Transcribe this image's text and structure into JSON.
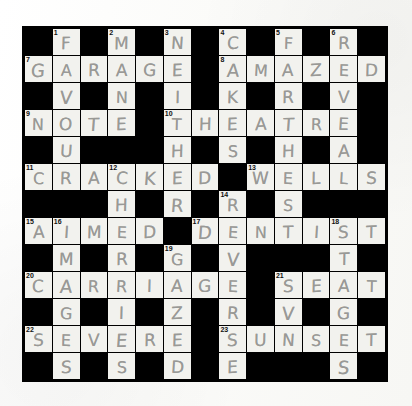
{
  "puzzle": {
    "type": "crossword-grid",
    "rows": 13,
    "cols": 13,
    "grid_background": "#000000",
    "cell_color": "#f2f2ee",
    "letter_color": "#8d8d8a",
    "number_color": "#111111",
    "layout_note": "Hand-filled crossword photographed on white paper",
    "cells": [
      [
        {
          "s": "black"
        },
        {
          "s": "white",
          "n": "1",
          "l": "F"
        },
        {
          "s": "black"
        },
        {
          "s": "white",
          "n": "2",
          "l": "M"
        },
        {
          "s": "black"
        },
        {
          "s": "white",
          "n": "3",
          "l": "N"
        },
        {
          "s": "black"
        },
        {
          "s": "white",
          "n": "4",
          "l": "C"
        },
        {
          "s": "black"
        },
        {
          "s": "white",
          "n": "5",
          "l": "F"
        },
        {
          "s": "black"
        },
        {
          "s": "white",
          "n": "6",
          "l": "R"
        },
        {
          "s": "black"
        }
      ],
      [
        {
          "s": "white",
          "n": "7",
          "l": "G"
        },
        {
          "s": "white",
          "l": "A"
        },
        {
          "s": "white",
          "l": "R"
        },
        {
          "s": "white",
          "l": "A"
        },
        {
          "s": "white",
          "l": "G"
        },
        {
          "s": "white",
          "l": "E"
        },
        {
          "s": "black"
        },
        {
          "s": "white",
          "n": "8",
          "l": "A"
        },
        {
          "s": "white",
          "l": "M"
        },
        {
          "s": "white",
          "l": "A"
        },
        {
          "s": "white",
          "l": "Z"
        },
        {
          "s": "white",
          "l": "E"
        },
        {
          "s": "white",
          "l": "D"
        }
      ],
      [
        {
          "s": "black"
        },
        {
          "s": "white",
          "l": "V"
        },
        {
          "s": "black"
        },
        {
          "s": "white",
          "l": "N"
        },
        {
          "s": "black"
        },
        {
          "s": "white",
          "l": "I"
        },
        {
          "s": "black"
        },
        {
          "s": "white",
          "l": "K"
        },
        {
          "s": "black"
        },
        {
          "s": "white",
          "l": "R"
        },
        {
          "s": "black"
        },
        {
          "s": "white",
          "l": "V"
        },
        {
          "s": "black"
        }
      ],
      [
        {
          "s": "white",
          "n": "9",
          "l": "N"
        },
        {
          "s": "white",
          "l": "O"
        },
        {
          "s": "white",
          "l": "T"
        },
        {
          "s": "white",
          "l": "E"
        },
        {
          "s": "black"
        },
        {
          "s": "white",
          "n": "10",
          "l": "T"
        },
        {
          "s": "white",
          "l": "H"
        },
        {
          "s": "white",
          "l": "E"
        },
        {
          "s": "white",
          "l": "A"
        },
        {
          "s": "white",
          "l": "T"
        },
        {
          "s": "white",
          "l": "R"
        },
        {
          "s": "white",
          "l": "E"
        },
        {
          "s": "black"
        }
      ],
      [
        {
          "s": "black"
        },
        {
          "s": "white",
          "l": "U"
        },
        {
          "s": "black"
        },
        {
          "s": "black"
        },
        {
          "s": "black"
        },
        {
          "s": "white",
          "l": "H"
        },
        {
          "s": "black"
        },
        {
          "s": "white",
          "l": "S"
        },
        {
          "s": "black"
        },
        {
          "s": "white",
          "l": "H"
        },
        {
          "s": "black"
        },
        {
          "s": "white",
          "l": "A"
        },
        {
          "s": "black"
        }
      ],
      [
        {
          "s": "white",
          "n": "11",
          "l": "C"
        },
        {
          "s": "white",
          "l": "R"
        },
        {
          "s": "white",
          "l": "A"
        },
        {
          "s": "white",
          "n": "12",
          "l": "C"
        },
        {
          "s": "white",
          "l": "K"
        },
        {
          "s": "white",
          "l": "E"
        },
        {
          "s": "white",
          "l": "D"
        },
        {
          "s": "black"
        },
        {
          "s": "white",
          "n": "13",
          "l": "W"
        },
        {
          "s": "white",
          "l": "E"
        },
        {
          "s": "white",
          "l": "L"
        },
        {
          "s": "white",
          "l": "L"
        },
        {
          "s": "white",
          "l": "S"
        }
      ],
      [
        {
          "s": "black"
        },
        {
          "s": "black"
        },
        {
          "s": "black"
        },
        {
          "s": "white",
          "l": "H"
        },
        {
          "s": "black"
        },
        {
          "s": "white",
          "l": "R"
        },
        {
          "s": "black"
        },
        {
          "s": "white",
          "n": "14",
          "l": "R"
        },
        {
          "s": "black"
        },
        {
          "s": "white",
          "l": "S"
        },
        {
          "s": "black"
        },
        {
          "s": "black"
        },
        {
          "s": "black"
        }
      ],
      [
        {
          "s": "white",
          "n": "15",
          "l": "A"
        },
        {
          "s": "white",
          "n": "16",
          "l": "I"
        },
        {
          "s": "white",
          "l": "M"
        },
        {
          "s": "white",
          "l": "E"
        },
        {
          "s": "white",
          "l": "D"
        },
        {
          "s": "black"
        },
        {
          "s": "white",
          "n": "17",
          "l": "D"
        },
        {
          "s": "white",
          "l": "E"
        },
        {
          "s": "white",
          "l": "N"
        },
        {
          "s": "white",
          "l": "T"
        },
        {
          "s": "white",
          "l": "I"
        },
        {
          "s": "white",
          "n": "18",
          "l": "S"
        },
        {
          "s": "white",
          "l": "T"
        }
      ],
      [
        {
          "s": "black"
        },
        {
          "s": "white",
          "l": "M"
        },
        {
          "s": "black"
        },
        {
          "s": "white",
          "l": "R"
        },
        {
          "s": "black"
        },
        {
          "s": "white",
          "n": "19",
          "l": "G"
        },
        {
          "s": "black"
        },
        {
          "s": "white",
          "l": "V"
        },
        {
          "s": "black"
        },
        {
          "s": "black"
        },
        {
          "s": "black"
        },
        {
          "s": "white",
          "l": "T"
        },
        {
          "s": "black"
        }
      ],
      [
        {
          "s": "white",
          "n": "20",
          "l": "C"
        },
        {
          "s": "white",
          "l": "A"
        },
        {
          "s": "white",
          "l": "R"
        },
        {
          "s": "white",
          "l": "R"
        },
        {
          "s": "white",
          "l": "I"
        },
        {
          "s": "white",
          "l": "A"
        },
        {
          "s": "white",
          "l": "G"
        },
        {
          "s": "white",
          "l": "E"
        },
        {
          "s": "black"
        },
        {
          "s": "white",
          "n": "21",
          "l": "S"
        },
        {
          "s": "white",
          "l": "E"
        },
        {
          "s": "white",
          "l": "A"
        },
        {
          "s": "white",
          "l": "T"
        }
      ],
      [
        {
          "s": "black"
        },
        {
          "s": "white",
          "l": "G"
        },
        {
          "s": "black"
        },
        {
          "s": "white",
          "l": "I"
        },
        {
          "s": "black"
        },
        {
          "s": "white",
          "l": "Z"
        },
        {
          "s": "black"
        },
        {
          "s": "white",
          "l": "R"
        },
        {
          "s": "black"
        },
        {
          "s": "white",
          "l": "V"
        },
        {
          "s": "black"
        },
        {
          "s": "white",
          "l": "G"
        },
        {
          "s": "black"
        }
      ],
      [
        {
          "s": "white",
          "n": "22",
          "l": "S"
        },
        {
          "s": "white",
          "l": "E"
        },
        {
          "s": "white",
          "l": "V"
        },
        {
          "s": "white",
          "l": "E"
        },
        {
          "s": "white",
          "l": "R"
        },
        {
          "s": "white",
          "l": "E"
        },
        {
          "s": "black"
        },
        {
          "s": "white",
          "n": "23",
          "l": "S"
        },
        {
          "s": "white",
          "l": "U"
        },
        {
          "s": "white",
          "l": "N"
        },
        {
          "s": "white",
          "l": "S"
        },
        {
          "s": "white",
          "l": "E"
        },
        {
          "s": "white",
          "l": "T"
        }
      ],
      [
        {
          "s": "black"
        },
        {
          "s": "white",
          "l": "S"
        },
        {
          "s": "black"
        },
        {
          "s": "white",
          "l": "S"
        },
        {
          "s": "black"
        },
        {
          "s": "white",
          "l": "D"
        },
        {
          "s": "black"
        },
        {
          "s": "white",
          "l": "E"
        },
        {
          "s": "black"
        },
        {
          "s": "black"
        },
        {
          "s": "black"
        },
        {
          "s": "white",
          "l": "S"
        },
        {
          "s": "black"
        }
      ]
    ],
    "answers_across": [
      {
        "number": "7",
        "answer": "GARAGE",
        "row": 1,
        "col": 0
      },
      {
        "number": "8",
        "answer": "AMAZED",
        "row": 1,
        "col": 7
      },
      {
        "number": "9",
        "answer": "NOTE",
        "row": 3,
        "col": 0
      },
      {
        "number": "10",
        "answer": "THEATRE",
        "row": 3,
        "col": 5
      },
      {
        "number": "11",
        "answer": "CRACKED",
        "row": 5,
        "col": 0
      },
      {
        "number": "13",
        "answer": "WELLS",
        "row": 5,
        "col": 8
      },
      {
        "number": "15",
        "answer": "AIMED",
        "row": 7,
        "col": 0
      },
      {
        "number": "17",
        "answer": "DENTIST",
        "row": 7,
        "col": 6
      },
      {
        "number": "20",
        "answer": "CARRIAGE",
        "row": 9,
        "col": 0
      },
      {
        "number": "21",
        "answer": "SEAT",
        "row": 9,
        "col": 9
      },
      {
        "number": "22",
        "answer": "SEVERE",
        "row": 11,
        "col": 0
      },
      {
        "number": "23",
        "answer": "SUNSET",
        "row": 11,
        "col": 7
      }
    ],
    "answers_down": [
      {
        "number": "1",
        "answer": "FAVOUR",
        "row": 0,
        "col": 1
      },
      {
        "number": "2",
        "answer": "MANTRA",
        "row": 0,
        "col": 3
      },
      {
        "number": "3",
        "answer": "NEITHER",
        "row": 0,
        "col": 5
      },
      {
        "number": "4",
        "answer": "CAKES",
        "row": 0,
        "col": 7
      },
      {
        "number": "5",
        "answer": "FAR",
        "row": 0,
        "col": 9
      },
      {
        "number": "6",
        "answer": "READ",
        "row": 0,
        "col": 11
      },
      {
        "number": "12",
        "answer": "CHRIS",
        "row": 5,
        "col": 3
      },
      {
        "number": "14",
        "answer": "RIVER",
        "row": 6,
        "col": 7
      },
      {
        "number": "16",
        "answer": "IMAGES",
        "row": 7,
        "col": 1
      },
      {
        "number": "18",
        "answer": "STAGES",
        "row": 7,
        "col": 11
      },
      {
        "number": "19",
        "answer": "GAZED",
        "row": 8,
        "col": 5
      }
    ]
  }
}
